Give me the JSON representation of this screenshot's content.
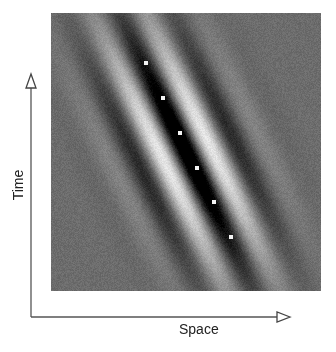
{
  "figure": {
    "type": "space-time receptive field (oriented Gabor)",
    "axes": {
      "xlabel": "Space",
      "ylabel": "Time"
    },
    "image": {
      "background_gray": 108,
      "center": [
        134,
        137
      ],
      "horizontal_period_px": 56,
      "stripe_direction": [
        17,
        35
      ],
      "sigma_along_stripes": 95,
      "sigma_across_stripes": 38,
      "center_phase": "dark",
      "amplitude": 150,
      "noise": 10
    },
    "markers": [
      {
        "x": 146,
        "y": 63
      },
      {
        "x": 163,
        "y": 98
      },
      {
        "x": 180,
        "y": 133
      },
      {
        "x": 197,
        "y": 168
      },
      {
        "x": 214,
        "y": 202
      },
      {
        "x": 231,
        "y": 237
      }
    ],
    "colors": {
      "axis_line": "#555555",
      "marker": "#f4f4f4",
      "label": "#222222"
    }
  }
}
